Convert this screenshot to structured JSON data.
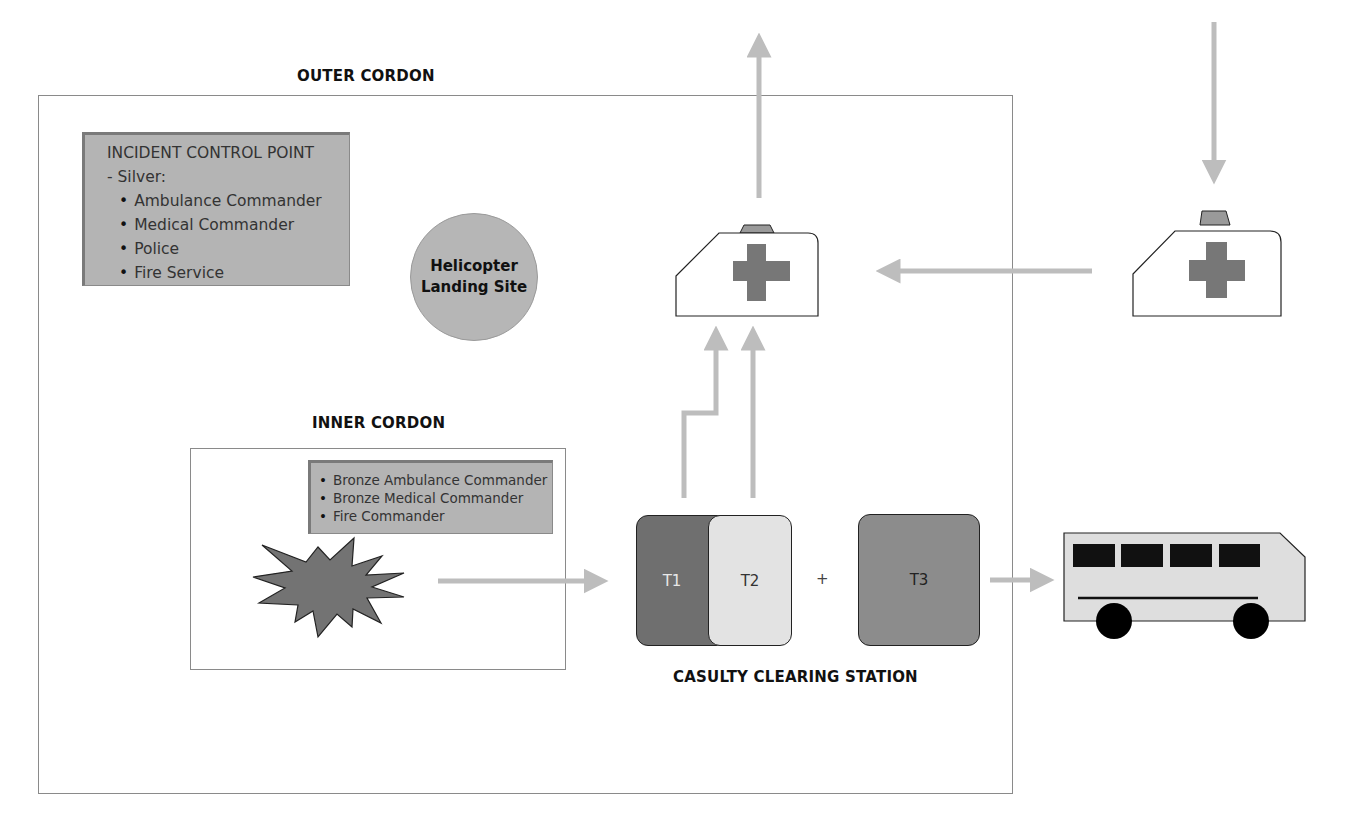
{
  "diagram": {
    "outer_cordon": {
      "label": "OUTER CORDON"
    },
    "inner_cordon": {
      "label": "INNER CORDON"
    },
    "incident_control_point": {
      "title": "INCIDENT CONTROL POINT",
      "subtitle": "-  Silver:",
      "items": [
        "Ambulance Commander",
        "Medical Commander",
        "Police",
        "Fire Service"
      ]
    },
    "helicopter_landing_site": {
      "line1": "Helicopter",
      "line2": "Landing Site"
    },
    "bronze_box": {
      "items": [
        "Bronze Ambulance Commander",
        "Bronze Medical Commander",
        "Fire Commander"
      ]
    },
    "casualty_clearing_station": {
      "label": "CASULTY CLEARING STATION",
      "t1": "T1",
      "t2": "T2",
      "plus": "+",
      "t3": "T3"
    },
    "icons": {
      "incident": "explosion-icon",
      "ambulance_inside": "ambulance-icon",
      "ambulance_outside": "ambulance-icon",
      "bus": "bus-icon"
    },
    "colors": {
      "arrow": "#bdbdbd",
      "border": "#8a8a8a",
      "info_fill": "#b4b4b4",
      "t1_fill": "#6f6f6f",
      "t2_fill": "#e3e3e3",
      "t3_fill": "#8c8c8c",
      "cross": "#777777"
    }
  }
}
